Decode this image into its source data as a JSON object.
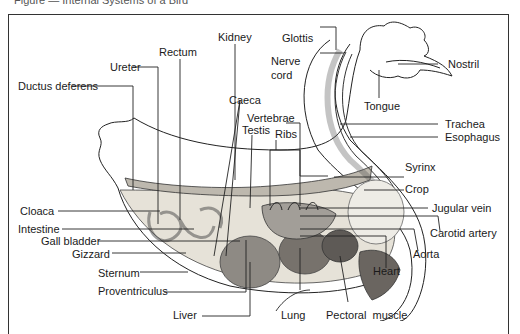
{
  "figure": {
    "caption": "Figure — Internal Systems of a Bird",
    "labels": {
      "kidney": "Kidney",
      "rectum": "Rectum",
      "ureter": "Ureter",
      "ductus_deferens": "Ductus deferens",
      "caeca": "Caeca",
      "testis": "Testis",
      "ribs": "Ribs",
      "vertebrae": "Vertebrae",
      "glottis": "Glottis",
      "nerve": "Nerve",
      "cord": "cord",
      "nostril": "Nostril",
      "tongue": "Tongue",
      "trachea": "Trachea",
      "esophagus": "Esophagus",
      "syrinx": "Syrinx",
      "crop": "Crop",
      "jugular_vein": "Jugular vein",
      "carotid_artery": "Carotid artery",
      "aorta": "Aorta",
      "heart": "Heart",
      "cloaca": "Cloaca",
      "intestine": "Intestine",
      "gall_bladder": "Gall bladder",
      "gizzard": "Gizzard",
      "sternum": "Sternum",
      "proventriculus": "Proventriculus",
      "liver": "Liver",
      "lung": "Lung",
      "pectoral_muscle": "Pectoral  muscle"
    }
  }
}
